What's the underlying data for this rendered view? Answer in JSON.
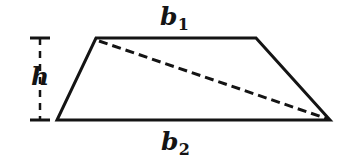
{
  "figure": {
    "kind": "geometry-diagram",
    "shape_name": "trapezoid",
    "canvas": {
      "width": 346,
      "height": 167,
      "background": "#ffffff"
    },
    "colors": {
      "stroke": "#141414",
      "dashed_stroke": "#141414",
      "label_text": "#141414",
      "background": "#ffffff"
    },
    "labels": {
      "top_base": {
        "base": "b",
        "subscript": "1",
        "full": "b1"
      },
      "bottom_base": {
        "base": "b",
        "subscript": "2",
        "full": "b2"
      },
      "height": {
        "base": "h",
        "subscript": "",
        "full": "h"
      }
    },
    "geometry": {
      "vertices": {
        "top_left": {
          "x": 96,
          "y": 38
        },
        "top_right": {
          "x": 256,
          "y": 38
        },
        "bottom_right": {
          "x": 330,
          "y": 120
        },
        "bottom_left": {
          "x": 57,
          "y": 120
        }
      },
      "edges": [
        {
          "name": "top-base-b1",
          "from": "top_left",
          "to": "top_right",
          "style": "solid"
        },
        {
          "name": "right-leg",
          "from": "top_right",
          "to": "bottom_right",
          "style": "solid"
        },
        {
          "name": "bottom-base-b2",
          "from": "bottom_right",
          "to": "bottom_left",
          "style": "solid"
        },
        {
          "name": "left-leg",
          "from": "bottom_left",
          "to": "top_left",
          "style": "solid"
        }
      ],
      "diagonal": {
        "name": "dashed-diagonal",
        "from": "top_left",
        "to": "bottom_right",
        "style": "dashed",
        "dash_length": 9,
        "gap_length": 5
      },
      "height_marker": {
        "x": 40,
        "top_y": 38,
        "bottom_y": 120,
        "serif_half_width": 10,
        "style": "dashed",
        "dash_length": 7,
        "gap_length": 6
      }
    },
    "stroke_widths": {
      "outline": 3,
      "diagonal": 3,
      "height_line": 2,
      "height_serif": 3
    }
  }
}
